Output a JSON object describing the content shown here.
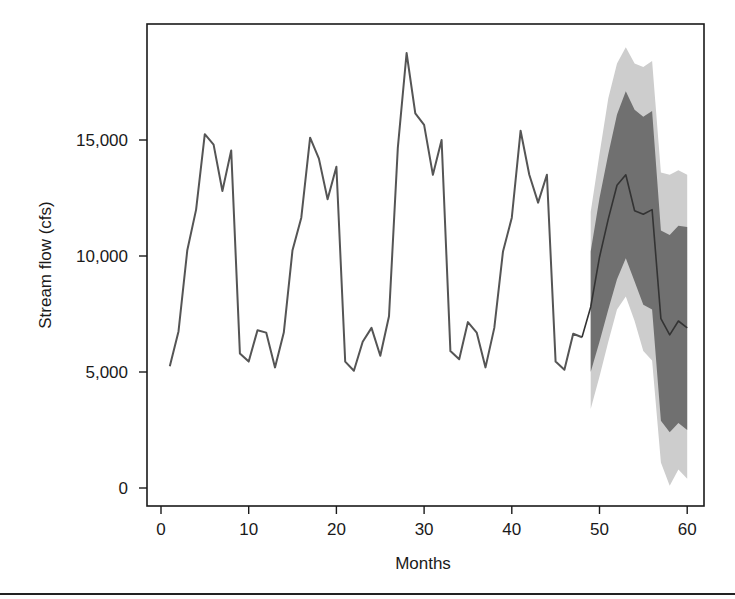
{
  "chart_data": {
    "type": "line",
    "title": "",
    "xlabel": "Months",
    "ylabel": "Stream flow (cfs)",
    "xlim": [
      0,
      60
    ],
    "ylim": [
      0,
      19500
    ],
    "x_ticks": [
      0,
      10,
      20,
      30,
      40,
      50,
      60
    ],
    "x_tick_labels": [
      "0",
      "10",
      "20",
      "30",
      "40",
      "50",
      "60"
    ],
    "y_ticks": [
      0,
      5000,
      10000,
      15000
    ],
    "y_tick_labels": [
      "0",
      "5,000",
      "10,000",
      "15,000"
    ],
    "grid": false,
    "legend": null,
    "series": [
      {
        "name": "Observed stream flow",
        "color": "#555555",
        "x": [
          1,
          2,
          3,
          4,
          5,
          6,
          7,
          8,
          9,
          10,
          11,
          12,
          13,
          14,
          15,
          16,
          17,
          18,
          19,
          20,
          21,
          22,
          23,
          24,
          25,
          26,
          27,
          28,
          29,
          30,
          31,
          32,
          33,
          34,
          35,
          36,
          37,
          38,
          39,
          40,
          41,
          42,
          43,
          44,
          45,
          46,
          47,
          48
        ],
        "values": [
          5250,
          6750,
          10250,
          12000,
          15250,
          14800,
          12800,
          14550,
          5800,
          5450,
          6800,
          6700,
          5200,
          6700,
          10250,
          11650,
          15100,
          14200,
          12450,
          13850,
          5450,
          5050,
          6300,
          6900,
          5700,
          7400,
          14650,
          18750,
          16150,
          15650,
          13500,
          15000,
          5900,
          5550,
          7150,
          6700,
          5200,
          6900,
          10200,
          11650,
          15400,
          13500,
          12300,
          13500,
          5450,
          5100,
          6650,
          6500
        ]
      },
      {
        "name": "Forecast",
        "color": "#333333",
        "x": [
          48,
          49,
          50,
          51,
          52,
          53,
          54,
          55,
          56,
          57,
          58,
          59,
          60
        ],
        "values": [
          6500,
          7800,
          9950,
          11600,
          13050,
          13500,
          11950,
          11800,
          12000,
          7300,
          6600,
          7200,
          6900
        ]
      },
      {
        "name": "Inner prediction interval",
        "type": "area",
        "color": "#707070",
        "x": [
          49,
          50,
          51,
          52,
          53,
          54,
          55,
          56,
          57,
          58,
          59,
          60
        ],
        "upper": [
          10200,
          12500,
          14400,
          16100,
          17100,
          16300,
          16000,
          16250,
          11100,
          10900,
          11300,
          11250
        ],
        "lower": [
          5000,
          6300,
          7700,
          9000,
          9900,
          8900,
          7900,
          7700,
          2900,
          2400,
          2800,
          2500
        ]
      },
      {
        "name": "Outer prediction interval",
        "type": "area",
        "color": "#cdcdcd",
        "x": [
          49,
          50,
          51,
          52,
          53,
          54,
          55,
          56,
          57,
          58,
          59,
          60
        ],
        "upper": [
          11900,
          14400,
          16800,
          18300,
          19000,
          18300,
          18150,
          18400,
          13600,
          13500,
          13700,
          13500
        ],
        "lower": [
          3400,
          4800,
          6300,
          7700,
          8250,
          7200,
          5900,
          5500,
          1100,
          100,
          800,
          400
        ]
      }
    ]
  }
}
